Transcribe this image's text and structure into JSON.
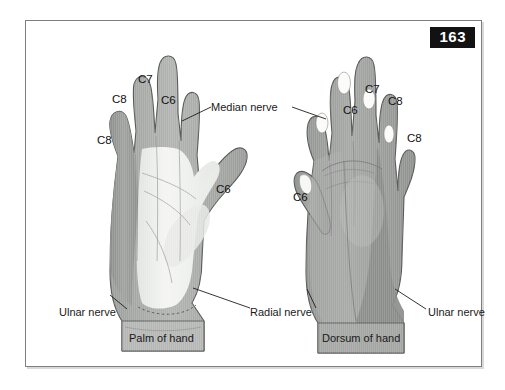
{
  "figure": {
    "page_number": "163",
    "captions": [
      {
        "text": "Palm of hand",
        "x": 118,
        "y": 318
      },
      {
        "text": "Dorsum of hand",
        "x": 315,
        "y": 318
      }
    ],
    "nerve_labels": [
      {
        "name": "median-nerve",
        "text": "Median nerve",
        "x": 200,
        "y": 105
      },
      {
        "name": "ulnar-nerve-palm",
        "text": "Ulnar nerve",
        "x": 33,
        "y": 291
      },
      {
        "name": "radial-nerve",
        "text": "Radial nerve",
        "x": 228,
        "y": 291
      },
      {
        "name": "ulnar-nerve-dorsum",
        "text": "Ulnar nerve",
        "x": 413,
        "y": 291
      }
    ],
    "dermatomes": {
      "palm": [
        {
          "text": "C8",
          "x": 93,
          "y": 121,
          "digit": "little-finger"
        },
        {
          "text": "C8",
          "x": 108,
          "y": 80,
          "digit": "ring-finger"
        },
        {
          "text": "C7",
          "x": 134,
          "y": 60,
          "digit": "middle-finger"
        },
        {
          "text": "C6",
          "x": 157,
          "y": 81,
          "digit": "index-finger"
        },
        {
          "text": "C6",
          "x": 212,
          "y": 170,
          "digit": "thumb"
        }
      ],
      "dorsum": [
        {
          "text": "C6",
          "x": 338,
          "y": 91,
          "digit": "index-finger"
        },
        {
          "text": "C7",
          "x": 360,
          "y": 70,
          "digit": "middle-finger"
        },
        {
          "text": "C8",
          "x": 383,
          "y": 82,
          "digit": "ring-finger"
        },
        {
          "text": "C8",
          "x": 401,
          "y": 119,
          "digit": "little-finger"
        },
        {
          "text": "C6",
          "x": 288,
          "y": 178,
          "digit": "thumb"
        }
      ]
    },
    "colors": {
      "skin_mid": "#a7a9a7",
      "skin_dark": "#8e908e",
      "palm_light": "#f1f2f0",
      "nail": "#fbfbfa",
      "outline": "#5a5c5a",
      "badge_bg": "#121212",
      "frame": "#7d7f7d"
    }
  }
}
